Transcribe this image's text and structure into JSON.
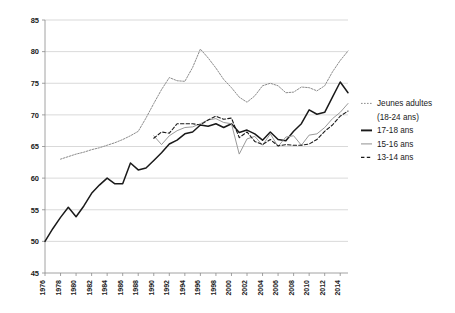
{
  "chart_data": {
    "type": "line",
    "title": "",
    "xlabel": "",
    "ylabel": "",
    "xlim": [
      1976,
      2015
    ],
    "ylim": [
      45,
      85
    ],
    "ytick_step": 5,
    "yticks": [
      45,
      50,
      55,
      60,
      65,
      70,
      75,
      80,
      85
    ],
    "xticks": [
      1976,
      1978,
      1980,
      1982,
      1984,
      1986,
      1988,
      1990,
      1992,
      1994,
      1996,
      1998,
      2000,
      2002,
      2004,
      2006,
      2008,
      2010,
      2012,
      2014
    ],
    "grid": "horizontal",
    "legend_position": "right",
    "series": [
      {
        "name": "Jeunes adultes",
        "name_line2": "(18-24 ans)",
        "style": "dotted",
        "color": "#8c8c8c",
        "x": [
          1978,
          1979,
          1980,
          1981,
          1982,
          1983,
          1984,
          1985,
          1986,
          1987,
          1988,
          1989,
          1990,
          1991,
          1992,
          1993,
          1994,
          1995,
          1996,
          1997,
          1998,
          1999,
          2000,
          2001,
          2002,
          2003,
          2004,
          2005,
          2006,
          2007,
          2008,
          2009,
          2010,
          2011,
          2012,
          2013,
          2014,
          2015
        ],
        "values": [
          63.0,
          63.4,
          63.8,
          64.1,
          64.5,
          64.8,
          65.2,
          65.6,
          66.1,
          66.7,
          67.4,
          69.5,
          71.8,
          74.0,
          75.9,
          75.4,
          75.3,
          77.5,
          80.4,
          79.0,
          77.4,
          75.6,
          74.3,
          72.8,
          72.0,
          73.0,
          74.6,
          75.0,
          74.6,
          73.5,
          73.6,
          74.4,
          74.3,
          73.8,
          74.6,
          76.8,
          78.6,
          80.1
        ]
      },
      {
        "name": "17-18 ans",
        "style": "solid",
        "color": "#1a1a1a",
        "width": 1.5,
        "x": [
          1976,
          1977,
          1978,
          1979,
          1980,
          1981,
          1982,
          1983,
          1984,
          1985,
          1986,
          1987,
          1988,
          1989,
          1990,
          1991,
          1992,
          1993,
          1994,
          1995,
          1996,
          1997,
          1998,
          1999,
          2000,
          2001,
          2002,
          2003,
          2004,
          2005,
          2006,
          2007,
          2008,
          2009,
          2010,
          2011,
          2012,
          2013,
          2014,
          2015
        ],
        "values": [
          50.0,
          52.0,
          53.8,
          55.4,
          53.9,
          55.6,
          57.6,
          58.9,
          60.0,
          59.1,
          59.1,
          62.4,
          61.3,
          61.6,
          62.8,
          64.0,
          65.4,
          66.0,
          67.0,
          67.3,
          68.4,
          68.2,
          68.6,
          68.0,
          68.6,
          67.2,
          67.6,
          67.0,
          66.0,
          67.3,
          66.1,
          65.9,
          67.4,
          68.6,
          70.8,
          70.1,
          70.4,
          72.8,
          75.2,
          73.5
        ]
      },
      {
        "name": "15-16 ans",
        "style": "solid",
        "color": "#9a9a9a",
        "width": 1.0,
        "x": [
          1990,
          1991,
          1992,
          1993,
          1994,
          1995,
          1996,
          1997,
          1998,
          1999,
          2000,
          2001,
          2002,
          2003,
          2004,
          2005,
          2006,
          2007,
          2008,
          2009,
          2010,
          2011,
          2012,
          2013,
          2014,
          2015
        ],
        "values": [
          66.7,
          65.3,
          66.7,
          67.5,
          68.0,
          68.1,
          68.6,
          69.2,
          69.4,
          68.8,
          68.6,
          63.8,
          66.2,
          66.6,
          65.2,
          67.0,
          65.0,
          66.5,
          66.7,
          65.2,
          66.8,
          67.0,
          68.0,
          69.4,
          70.4,
          71.8
        ]
      },
      {
        "name": "13-14 ans",
        "style": "dashed",
        "color": "#1a1a1a",
        "width": 1.1,
        "x": [
          1990,
          1991,
          1992,
          1993,
          1994,
          1995,
          1996,
          1997,
          1998,
          1999,
          2000,
          2001,
          2002,
          2003,
          2004,
          2005,
          2006,
          2007,
          2008,
          2009,
          2010,
          2011,
          2012,
          2013,
          2014,
          2015
        ],
        "values": [
          66.3,
          67.3,
          67.1,
          68.6,
          68.6,
          68.6,
          68.4,
          69.2,
          69.8,
          69.3,
          69.5,
          66.4,
          67.3,
          65.8,
          65.3,
          66.1,
          65.1,
          65.3,
          65.2,
          65.2,
          65.4,
          66.1,
          67.4,
          68.4,
          69.8,
          70.6
        ]
      }
    ]
  },
  "legend": {
    "items": [
      {
        "label": "Jeunes adultes",
        "label2": "(18-24 ans)",
        "style": "dotted"
      },
      {
        "label": "17-18 ans",
        "style": "solid-black"
      },
      {
        "label": "15-16 ans",
        "style": "solid-gray"
      },
      {
        "label": "13-14 ans",
        "style": "dashed"
      }
    ]
  }
}
